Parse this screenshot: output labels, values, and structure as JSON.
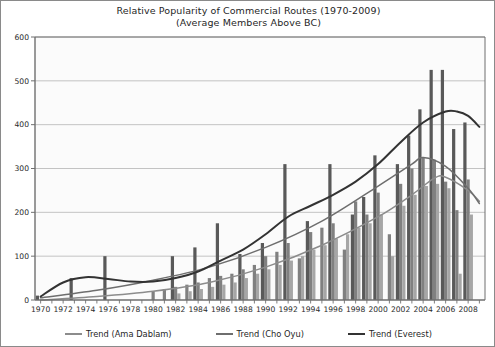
{
  "chart_data": {
    "type": "bar",
    "title": "Relative Popularity of Commercial Routes (1970-2009)",
    "subtitle": "(Average Members Above BC)",
    "xlabel": "",
    "ylabel": "",
    "ylim": [
      0,
      600
    ],
    "yticks": [
      0,
      100,
      200,
      300,
      400,
      500,
      600
    ],
    "grid": true,
    "legend_position": "bottom",
    "categories": [
      1970,
      1971,
      1972,
      1973,
      1974,
      1975,
      1976,
      1977,
      1978,
      1979,
      1980,
      1981,
      1982,
      1983,
      1984,
      1985,
      1986,
      1987,
      1988,
      1989,
      1990,
      1991,
      1992,
      1993,
      1994,
      1995,
      1996,
      1997,
      1998,
      1999,
      2000,
      2001,
      2002,
      2003,
      2004,
      2005,
      2006,
      2007,
      2008,
      2009
    ],
    "xtick_labels": [
      "1970",
      "1972",
      "1974",
      "1976",
      "1978",
      "1980",
      "1982",
      "1984",
      "1986",
      "1988",
      "1990",
      "1992",
      "1994",
      "1996",
      "1998",
      "2000",
      "2002",
      "2004",
      "2006",
      "2008"
    ],
    "series": [
      {
        "name": "Everest",
        "color": "#595959",
        "values": [
          10,
          0,
          0,
          50,
          0,
          0,
          100,
          0,
          0,
          0,
          0,
          0,
          100,
          0,
          120,
          0,
          175,
          0,
          105,
          0,
          130,
          0,
          310,
          0,
          180,
          0,
          310,
          0,
          195,
          235,
          330,
          0,
          310,
          375,
          435,
          525,
          525,
          390,
          405,
          0
        ]
      },
      {
        "name": "Cho Oyu",
        "color": "#808080",
        "values": [
          0,
          0,
          0,
          0,
          0,
          0,
          0,
          0,
          0,
          0,
          20,
          25,
          30,
          35,
          40,
          50,
          55,
          60,
          70,
          80,
          100,
          110,
          130,
          95,
          155,
          165,
          175,
          115,
          225,
          195,
          245,
          150,
          265,
          300,
          325,
          320,
          270,
          205,
          275,
          0
        ]
      },
      {
        "name": "Ama Dablam",
        "color": "#a6a6a6",
        "values": [
          0,
          0,
          0,
          0,
          0,
          0,
          0,
          0,
          0,
          0,
          0,
          0,
          15,
          20,
          25,
          30,
          35,
          40,
          50,
          60,
          70,
          80,
          90,
          100,
          115,
          125,
          140,
          150,
          165,
          175,
          195,
          100,
          215,
          240,
          260,
          265,
          255,
          60,
          195,
          0
        ]
      }
    ],
    "trend_lines": [
      {
        "name": "Trend (Ama Dablam)",
        "color": "#8c8c8c",
        "points": [
          [
            1970,
            0
          ],
          [
            1975,
            8
          ],
          [
            1980,
            20
          ],
          [
            1985,
            40
          ],
          [
            1990,
            75
          ],
          [
            1995,
            125
          ],
          [
            2000,
            190
          ],
          [
            2003,
            240
          ],
          [
            2005,
            278
          ],
          [
            2006,
            280
          ],
          [
            2008,
            250
          ],
          [
            2009,
            225
          ]
        ]
      },
      {
        "name": "Trend (Cho Oyu)",
        "color": "#6e6e6e",
        "points": [
          [
            1970,
            5
          ],
          [
            1975,
            22
          ],
          [
            1980,
            45
          ],
          [
            1985,
            75
          ],
          [
            1990,
            120
          ],
          [
            1995,
            180
          ],
          [
            2000,
            260
          ],
          [
            2003,
            310
          ],
          [
            2004,
            325
          ],
          [
            2006,
            305
          ],
          [
            2008,
            255
          ],
          [
            2009,
            220
          ]
        ]
      },
      {
        "name": "Trend (Everest)",
        "color": "#333333",
        "points": [
          [
            1970,
            8
          ],
          [
            1972,
            40
          ],
          [
            1974,
            52
          ],
          [
            1976,
            48
          ],
          [
            1978,
            42
          ],
          [
            1980,
            42
          ],
          [
            1982,
            50
          ],
          [
            1984,
            65
          ],
          [
            1986,
            90
          ],
          [
            1988,
            115
          ],
          [
            1990,
            150
          ],
          [
            1992,
            190
          ],
          [
            1994,
            215
          ],
          [
            1996,
            240
          ],
          [
            1998,
            270
          ],
          [
            2000,
            310
          ],
          [
            2002,
            360
          ],
          [
            2004,
            405
          ],
          [
            2006,
            430
          ],
          [
            2007,
            430
          ],
          [
            2008,
            420
          ],
          [
            2009,
            395
          ]
        ]
      }
    ]
  },
  "legend": {
    "entries": [
      {
        "label": "Trend (Ama Dablam)",
        "color": "#8c8c8c"
      },
      {
        "label": "Trend (Cho Oyu)",
        "color": "#6e6e6e"
      },
      {
        "label": "Trend (Everest)",
        "color": "#333333"
      }
    ]
  },
  "colors": {
    "plot_background": "#fbfbfb",
    "grid": "#b5b5b5",
    "axis": "#6f6f6f",
    "border": "#8a8a8a",
    "text": "#1f1f1f"
  }
}
